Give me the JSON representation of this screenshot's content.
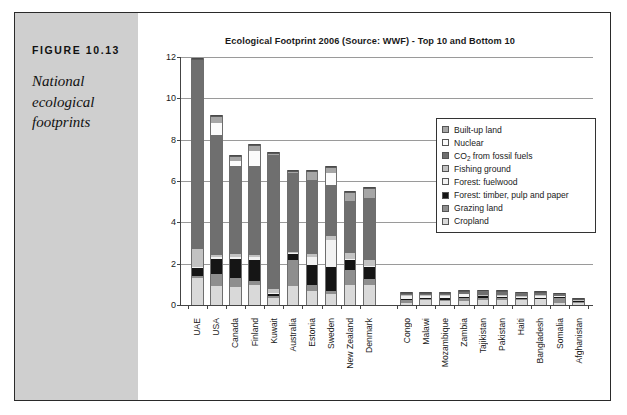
{
  "figure": {
    "number": "FIGURE 10.13",
    "caption": "National ecological footprints"
  },
  "chart_data": {
    "type": "bar",
    "subtype": "stacked-bar",
    "title": "Ecological Footprint 2006 (Source: WWF) - Top 10 and Bottom 10",
    "xlabel": "",
    "ylabel": "",
    "ylim": [
      0,
      12
    ],
    "yticks": [
      0,
      2,
      4,
      6,
      8,
      10,
      12
    ],
    "grid": true,
    "legend_position": "inside-upper-right",
    "categories": [
      "UAE",
      "USA",
      "Canada",
      "Finland",
      "Kuwait",
      "Australia",
      "Estonia",
      "Sweden",
      "New Zealand",
      "Denmark",
      "Congo",
      "Malawi",
      "Mozambique",
      "Zambia",
      "Tajikistan",
      "Pakistan",
      "Haiti",
      "Bangladesh",
      "Somalia",
      "Afghanistan"
    ],
    "group_break_after": "Denmark",
    "series": [
      {
        "name": "Cropland",
        "color": "#d9d9d9",
        "values": [
          1.3,
          0.9,
          0.85,
          0.95,
          0.35,
          0.9,
          0.7,
          0.55,
          0.95,
          0.95,
          0.12,
          0.22,
          0.18,
          0.2,
          0.22,
          0.25,
          0.22,
          0.28,
          0.12,
          0.1
        ]
      },
      {
        "name": "Grazing land",
        "color": "#8e8e8e",
        "values": [
          0.12,
          0.6,
          0.45,
          0.2,
          0.08,
          1.3,
          0.25,
          0.15,
          0.75,
          0.3,
          0.1,
          0.06,
          0.08,
          0.12,
          0.14,
          0.1,
          0.06,
          0.04,
          0.22,
          0.06
        ]
      },
      {
        "name": "Forest: timber, pulp and paper",
        "color": "#151515",
        "values": [
          0.35,
          0.75,
          0.95,
          1.05,
          0.1,
          0.25,
          1.0,
          1.15,
          0.5,
          0.6,
          0.08,
          0.06,
          0.08,
          0.08,
          0.06,
          0.05,
          0.04,
          0.04,
          0.04,
          0.03
        ]
      },
      {
        "name": "Forest: fuelwood",
        "color": "#f2f2f2",
        "values": [
          0.05,
          0.05,
          0.08,
          0.12,
          0.05,
          0.05,
          0.35,
          1.3,
          0.05,
          0.05,
          0.14,
          0.1,
          0.12,
          0.12,
          0.05,
          0.06,
          0.1,
          0.06,
          0.05,
          0.03
        ]
      },
      {
        "name": "Fishing ground",
        "color": "#c2c2c2",
        "values": [
          0.9,
          0.1,
          0.12,
          0.12,
          0.2,
          0.08,
          0.15,
          0.2,
          0.25,
          0.3,
          0.03,
          0.03,
          0.03,
          0.03,
          0.02,
          0.03,
          0.04,
          0.06,
          0.03,
          0.01
        ]
      },
      {
        "name": "CO2 from fossil fuels",
        "color": "#6f6f6f",
        "values": [
          9.15,
          5.85,
          4.3,
          4.3,
          6.5,
          3.8,
          3.6,
          2.45,
          2.55,
          3.0,
          0.08,
          0.06,
          0.06,
          0.08,
          0.18,
          0.16,
          0.1,
          0.12,
          0.06,
          0.03
        ]
      },
      {
        "name": "Nuclear",
        "color": "#fbfbfb",
        "values": [
          0.0,
          0.55,
          0.2,
          0.7,
          0.0,
          0.0,
          0.0,
          0.6,
          0.0,
          0.0,
          0.0,
          0.0,
          0.0,
          0.0,
          0.0,
          0.0,
          0.0,
          0.0,
          0.0,
          0.0
        ]
      },
      {
        "name": "Built-up land",
        "color": "#a6a6a6",
        "values": [
          0.03,
          0.35,
          0.25,
          0.3,
          0.07,
          0.12,
          0.45,
          0.3,
          0.4,
          0.45,
          0.03,
          0.03,
          0.03,
          0.03,
          0.03,
          0.03,
          0.03,
          0.03,
          0.02,
          0.01
        ]
      }
    ],
    "totals": [
      11.9,
      9.15,
      7.2,
      7.74,
      7.35,
      6.5,
      6.5,
      6.7,
      5.45,
      5.65,
      0.58,
      0.56,
      0.58,
      0.66,
      0.7,
      0.68,
      0.59,
      0.63,
      0.54,
      0.27
    ],
    "legend_order_top_to_bottom": [
      "Built-up land",
      "Nuclear",
      "CO2 from fossil fuels",
      "Fishing ground",
      "Forest: fuelwood",
      "Forest: timber, pulp and paper",
      "Grazing land",
      "Cropland"
    ],
    "legend_labels": [
      {
        "label": "Built-up land",
        "sub": null,
        "color": "#a6a6a6"
      },
      {
        "label": "Nuclear",
        "sub": null,
        "color": "#fbfbfb"
      },
      {
        "label": "CO",
        "sub": "2",
        "label_after": " from fossil fuels",
        "color": "#6f6f6f"
      },
      {
        "label": "Fishing ground",
        "sub": null,
        "color": "#c2c2c2"
      },
      {
        "label": "Forest: fuelwood",
        "sub": null,
        "color": "#f2f2f2"
      },
      {
        "label": "Forest: timber, pulp and paper",
        "sub": null,
        "color": "#151515"
      },
      {
        "label": "Grazing land",
        "sub": null,
        "color": "#8e8e8e"
      },
      {
        "label": "Cropland",
        "sub": null,
        "color": "#d9d9d9"
      }
    ]
  }
}
